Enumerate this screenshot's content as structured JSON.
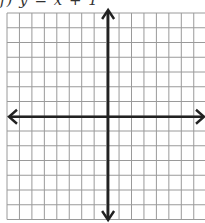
{
  "problem": {
    "label": "f)  y = x + 1",
    "equation": "y = x + 1"
  },
  "grid": {
    "left": 7,
    "top": 13,
    "col_width": 12.45,
    "row_height": 14.75,
    "cols": 16,
    "rows": 14,
    "y_axis_col": 8,
    "x_axis_row": 7,
    "grid_color": "#9a9a9a",
    "axis_color": "#222222"
  }
}
